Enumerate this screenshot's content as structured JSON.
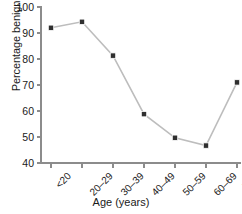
{
  "chart_data": {
    "type": "line",
    "title": "",
    "xlabel": "Age (years)",
    "ylabel": "Percentage benign",
    "categories": [
      "<20",
      "20–29",
      "30–39",
      "40–49",
      "50–59",
      "60–69",
      ">69"
    ],
    "values": [
      92.0,
      94.3,
      81.3,
      58.8,
      49.7,
      46.7,
      71.0
    ],
    "ylim": [
      40,
      100
    ],
    "yticks": [
      40,
      50,
      60,
      70,
      80,
      90,
      100
    ],
    "ytick_labels": [
      "40",
      "50",
      "60",
      "70",
      "80",
      "90",
      "100"
    ],
    "grid": false,
    "legend": false,
    "marker": "square",
    "marker_color": "#2f2f2f",
    "line_color": "#bdbdbd",
    "axis_color": "#8c8c8c",
    "background": "#ffffff"
  }
}
